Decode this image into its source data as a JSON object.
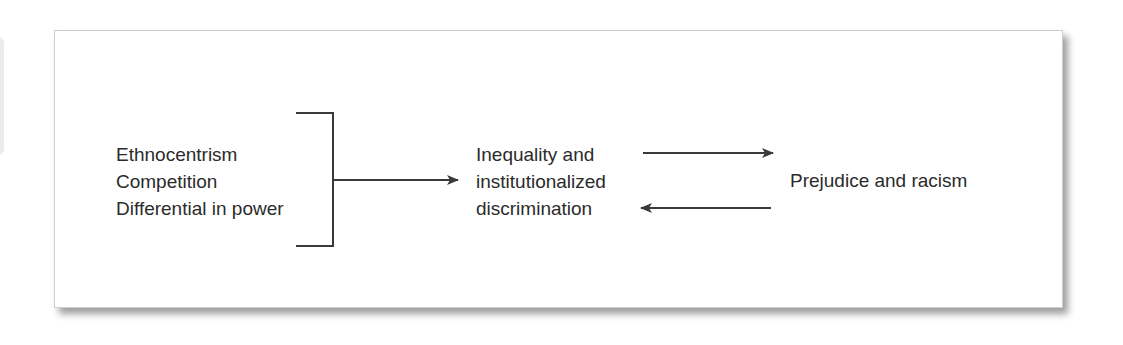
{
  "diagram": {
    "causes": [
      "Ethnocentrism",
      "Competition",
      "Differential in power"
    ],
    "middle": [
      "Inequality and",
      "institutionalized",
      "discrimination"
    ],
    "outcome": "Prejudice and racism",
    "edges": [
      {
        "from": "causes",
        "to": "middle",
        "type": "bracket-arrow"
      },
      {
        "from": "middle",
        "to": "outcome",
        "type": "arrow"
      },
      {
        "from": "outcome",
        "to": "middle",
        "type": "arrow"
      }
    ],
    "colors": {
      "line": "#3a3a3a",
      "text": "#2b2b2b",
      "border": "#cfcfcf"
    }
  }
}
